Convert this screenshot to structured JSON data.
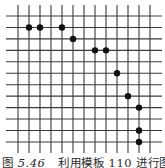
{
  "figure": {
    "caption": {
      "label": "图",
      "number": "5.46",
      "text": "利用模板 110 进行图案收"
    },
    "grid": {
      "columns": 13,
      "rows": 12,
      "x0": 18,
      "y0": 16,
      "dx": 11.0,
      "dy": 11.45,
      "h_line_x_start": 6,
      "h_line_x_end": 162,
      "v_line_y_start": 5,
      "v_line_y_end": 153,
      "line_color": "#3a3a3a",
      "dot_color": "#111111",
      "dot_radius": 3.2
    },
    "dots": [
      {
        "col": 1,
        "row": 1
      },
      {
        "col": 2,
        "row": 1
      },
      {
        "col": 4,
        "row": 1
      },
      {
        "col": 5,
        "row": 2
      },
      {
        "col": 7,
        "row": 3
      },
      {
        "col": 8,
        "row": 3
      },
      {
        "col": 9,
        "row": 5
      },
      {
        "col": 10,
        "row": 7
      },
      {
        "col": 11,
        "row": 8
      },
      {
        "col": 11,
        "row": 10
      },
      {
        "col": 11,
        "row": 11
      }
    ]
  }
}
